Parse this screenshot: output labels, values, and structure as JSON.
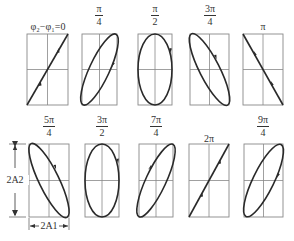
{
  "phase_symbol": "φ2 − φ1 = 0",
  "dimension_labels": {
    "vertical": "2A2",
    "horizontal": "2A1"
  },
  "panels": [
    {
      "label_num": "φ₂−φ₁=0",
      "label_den": "",
      "phase": "0",
      "shape": "line-positive"
    },
    {
      "label_num": "π",
      "label_den": "4",
      "phase": "π/4",
      "shape": "ellipse-tilt-right"
    },
    {
      "label_num": "π",
      "label_den": "2",
      "phase": "π/2",
      "shape": "ellipse-upright"
    },
    {
      "label_num": "3π",
      "label_den": "4",
      "phase": "3π/4",
      "shape": "ellipse-tilt-left"
    },
    {
      "label_num": "π",
      "label_den": "",
      "phase": "π",
      "shape": "line-negative"
    },
    {
      "label_num": "5π",
      "label_den": "4",
      "phase": "5π/4",
      "shape": "ellipse-tilt-left"
    },
    {
      "label_num": "3π",
      "label_den": "2",
      "phase": "3π/2",
      "shape": "ellipse-upright"
    },
    {
      "label_num": "7π",
      "label_den": "4",
      "phase": "7π/4",
      "shape": "ellipse-tilt-right"
    },
    {
      "label_num": "2π",
      "label_den": "",
      "phase": "2π",
      "shape": "line-positive"
    },
    {
      "label_num": "9π",
      "label_den": "4",
      "phase": "9π/4",
      "shape": "ellipse-tilt-right"
    }
  ],
  "colors": {
    "frame": "#888888",
    "curve": "#2a2a2a"
  }
}
